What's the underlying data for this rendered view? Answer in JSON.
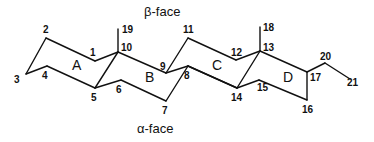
{
  "diagram": {
    "faces": {
      "top": "β-face",
      "bottom": "α-face"
    },
    "rings": [
      {
        "label": "A",
        "x": 72,
        "y": 70
      },
      {
        "label": "B",
        "x": 145,
        "y": 82
      },
      {
        "label": "C",
        "x": 212,
        "y": 70
      },
      {
        "label": "D",
        "x": 283,
        "y": 82
      }
    ],
    "atoms": {
      "1": {
        "x": 95,
        "y": 61,
        "lx": 90,
        "ly": 56
      },
      "2": {
        "x": 46,
        "y": 38,
        "lx": 43,
        "ly": 33
      },
      "3": {
        "x": 26,
        "y": 74,
        "lx": 14,
        "ly": 83
      },
      "4": {
        "x": 47,
        "y": 66,
        "lx": 42,
        "ly": 79
      },
      "5": {
        "x": 95,
        "y": 88,
        "lx": 91,
        "ly": 101
      },
      "6": {
        "x": 121,
        "y": 80,
        "lx": 116,
        "ly": 93
      },
      "7": {
        "x": 166,
        "y": 101,
        "lx": 162,
        "ly": 114
      },
      "8": {
        "x": 188,
        "y": 66,
        "lx": 184,
        "ly": 79
      },
      "9": {
        "x": 166,
        "y": 73,
        "lx": 160,
        "ly": 70
      },
      "10": {
        "x": 118,
        "y": 52,
        "lx": 121,
        "ly": 51
      },
      "11": {
        "x": 188,
        "y": 38,
        "lx": 183,
        "ly": 33
      },
      "12": {
        "x": 236,
        "y": 60,
        "lx": 231,
        "ly": 56
      },
      "13": {
        "x": 260,
        "y": 51,
        "lx": 263,
        "ly": 51
      },
      "14": {
        "x": 237,
        "y": 88,
        "lx": 231,
        "ly": 101
      },
      "15": {
        "x": 259,
        "y": 80,
        "lx": 257,
        "ly": 91
      },
      "16": {
        "x": 307,
        "y": 100,
        "lx": 302,
        "ly": 113
      },
      "17": {
        "x": 307,
        "y": 72,
        "lx": 310,
        "ly": 81
      },
      "18": {
        "x": 260,
        "y": 27,
        "lx": 263,
        "ly": 31
      },
      "19": {
        "x": 118,
        "y": 29,
        "lx": 122,
        "ly": 33
      },
      "20": {
        "x": 325,
        "y": 63,
        "lx": 320,
        "ly": 60
      },
      "21": {
        "x": 350,
        "y": 79,
        "lx": 347,
        "ly": 86
      }
    },
    "bonds": [
      [
        "3",
        "2"
      ],
      [
        "2",
        "1"
      ],
      [
        "1",
        "10"
      ],
      [
        "10",
        "9"
      ],
      [
        "9",
        "11"
      ],
      [
        "11",
        "12"
      ],
      [
        "12",
        "13"
      ],
      [
        "13",
        "17"
      ],
      [
        "3",
        "4"
      ],
      [
        "4",
        "5"
      ],
      [
        "5",
        "6"
      ],
      [
        "6",
        "7"
      ],
      [
        "7",
        "8"
      ],
      [
        "8",
        "14"
      ],
      [
        "14",
        "15"
      ],
      [
        "15",
        "16"
      ],
      [
        "16",
        "17"
      ],
      [
        "5",
        "10"
      ],
      [
        "9",
        "8"
      ],
      [
        "8",
        "14"
      ],
      [
        "14",
        "13"
      ],
      [
        "10",
        "19"
      ],
      [
        "13",
        "18"
      ],
      [
        "17",
        "20"
      ],
      [
        "20",
        "21"
      ]
    ]
  }
}
